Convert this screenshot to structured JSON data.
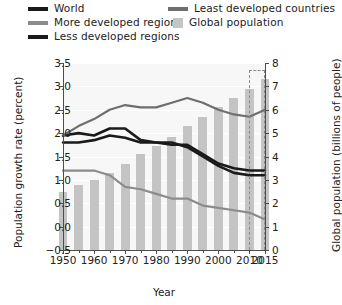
{
  "legend": {
    "items": [
      {
        "label": "World",
        "type": "line",
        "color": "#1a1a1a",
        "col": 0,
        "row": 0
      },
      {
        "label": "More developed regions",
        "type": "line",
        "color": "#8c8c8c",
        "col": 0,
        "row": 1
      },
      {
        "label": "Less developed regions",
        "type": "line",
        "color": "#1a1a1a",
        "col": 0,
        "row": 2
      },
      {
        "label": "Least developed countries",
        "type": "line",
        "color": "#6e6e6e",
        "col": 1,
        "row": 0
      },
      {
        "label": "Global population",
        "type": "box",
        "color": "#c4c4c4",
        "col": 1,
        "row": 1
      }
    ]
  },
  "chart_data": {
    "type": "line",
    "title": "",
    "xlabel": "Year",
    "ylabel": "Population growth rate (percent)",
    "y2label": "Global population (billions of people)",
    "xlim": [
      1950,
      2015
    ],
    "ylim": [
      -0.5,
      3.5
    ],
    "y2lim": [
      0,
      8
    ],
    "yticks": [
      "3.5",
      "3.0",
      "2.5",
      "2.0",
      "1.5",
      "1.0",
      "0.5",
      "0.0",
      "−0.5"
    ],
    "ytick_values": [
      3.5,
      3.0,
      2.5,
      2.0,
      1.5,
      1.0,
      0.5,
      0.0,
      -0.5
    ],
    "y2ticks": [
      "8",
      "7",
      "6",
      "5",
      "4",
      "3",
      "2",
      "1",
      "0"
    ],
    "y2tick_values": [
      8,
      7,
      6,
      5,
      4,
      3,
      2,
      1,
      0
    ],
    "xticks": [
      "1950",
      "1960",
      "1970",
      "1980",
      "1990",
      "2000",
      "2010",
      "2015"
    ],
    "xtick_values": [
      1950,
      1960,
      1970,
      1980,
      1990,
      2000,
      2010,
      2015
    ],
    "xticks_minor": [
      1955,
      1965,
      1975,
      1985,
      1995,
      2005
    ],
    "grid": "horizontal",
    "legend_position": "above-plot",
    "annotations": [
      {
        "name": "projection-region",
        "type": "dashed-box",
        "x_start": 2010,
        "x_end": 2015,
        "note": "dashed box marks projected values"
      }
    ],
    "bars": {
      "name": "Global population",
      "axis": "right",
      "unit": "billions of people",
      "color": "#c4c4c4",
      "x": [
        1950,
        1955,
        1960,
        1965,
        1970,
        1975,
        1980,
        1985,
        1990,
        1995,
        2000,
        2005,
        2010,
        2015
      ],
      "values": [
        2.5,
        2.8,
        3.0,
        3.3,
        3.7,
        4.1,
        4.45,
        4.85,
        5.3,
        5.7,
        6.1,
        6.5,
        6.9,
        7.3
      ]
    },
    "series": [
      {
        "name": "World",
        "axis": "left",
        "color": "#1a1a1a",
        "width": 2.6,
        "x": [
          1950,
          1955,
          1960,
          1965,
          1970,
          1975,
          1980,
          1985,
          1990,
          1995,
          2000,
          2005,
          2010,
          2015
        ],
        "values": [
          1.95,
          2.0,
          1.95,
          2.1,
          2.1,
          1.85,
          1.8,
          1.75,
          1.75,
          1.55,
          1.35,
          1.25,
          1.2,
          1.2
        ]
      },
      {
        "name": "More developed regions",
        "axis": "left",
        "color": "#8c8c8c",
        "width": 2.2,
        "x": [
          1950,
          1955,
          1960,
          1965,
          1970,
          1975,
          1980,
          1985,
          1990,
          1995,
          2000,
          2005,
          2010,
          2015
        ],
        "values": [
          1.2,
          1.2,
          1.2,
          1.1,
          0.85,
          0.8,
          0.7,
          0.6,
          0.6,
          0.45,
          0.4,
          0.35,
          0.3,
          0.15
        ]
      },
      {
        "name": "Less developed regions",
        "axis": "left",
        "color": "#1a1a1a",
        "width": 2.6,
        "x": [
          1950,
          1955,
          1960,
          1965,
          1970,
          1975,
          1980,
          1985,
          1990,
          1995,
          2000,
          2005,
          2010,
          2015
        ],
        "values": [
          1.8,
          1.8,
          1.85,
          1.95,
          1.9,
          1.8,
          1.8,
          1.8,
          1.7,
          1.5,
          1.3,
          1.15,
          1.1,
          1.1
        ]
      },
      {
        "name": "Least developed countries",
        "axis": "left",
        "color": "#6e6e6e",
        "width": 2.2,
        "x": [
          1950,
          1955,
          1960,
          1965,
          1970,
          1975,
          1980,
          1985,
          1990,
          1995,
          2000,
          2005,
          2010,
          2015
        ],
        "values": [
          1.95,
          2.15,
          2.3,
          2.5,
          2.6,
          2.55,
          2.55,
          2.65,
          2.75,
          2.65,
          2.5,
          2.4,
          2.35,
          2.5
        ]
      }
    ]
  }
}
